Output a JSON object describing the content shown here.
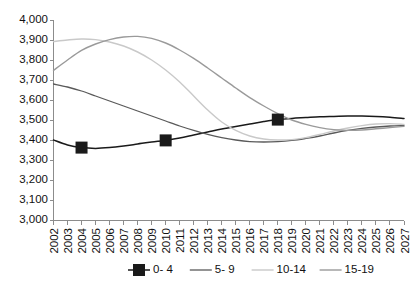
{
  "chart_data": {
    "type": "line",
    "title": "",
    "subtitle": "",
    "xlabel": "",
    "ylabel": "",
    "grid": false,
    "legend_position": "bottom",
    "ylim": [
      3000,
      4000
    ],
    "ytick_step": 100,
    "ytick_labels": [
      "4,000",
      "3,900",
      "3,800",
      "3,700",
      "3,600",
      "3,500",
      "3,400",
      "3,300",
      "3,200",
      "3,100",
      "3,000"
    ],
    "ytick_values": [
      4000,
      3900,
      3800,
      3700,
      3600,
      3500,
      3400,
      3300,
      3200,
      3100,
      3000
    ],
    "categories": [
      "2002",
      "2003",
      "2004",
      "2005",
      "2006",
      "2007",
      "2008",
      "2009",
      "2010",
      "2011",
      "2012",
      "2013",
      "2014",
      "2015",
      "2016",
      "2017",
      "2018",
      "2019",
      "2020",
      "2021",
      "2022",
      "2023",
      "2024",
      "2025",
      "2026",
      "2027"
    ],
    "x": [
      2002,
      2003,
      2004,
      2005,
      2006,
      2007,
      2008,
      2009,
      2010,
      2011,
      2012,
      2013,
      2014,
      2015,
      2016,
      2017,
      2018,
      2019,
      2020,
      2021,
      2022,
      2023,
      2024,
      2025,
      2026,
      2027
    ],
    "series": [
      {
        "name": "0- 4",
        "color": "#1a1a1a",
        "width": 1.5,
        "marker": "square",
        "marker_years": [
          2004,
          2010,
          2018
        ],
        "values": [
          3400,
          3375,
          3362,
          3358,
          3362,
          3370,
          3380,
          3390,
          3398,
          3410,
          3425,
          3440,
          3455,
          3468,
          3480,
          3492,
          3502,
          3508,
          3512,
          3516,
          3518,
          3520,
          3520,
          3518,
          3514,
          3508
        ]
      },
      {
        "name": "5- 9",
        "color": "#5a5a5a",
        "width": 1.3,
        "marker": "none",
        "marker_years": [],
        "values": [
          3680,
          3665,
          3645,
          3620,
          3595,
          3570,
          3545,
          3520,
          3495,
          3470,
          3448,
          3428,
          3412,
          3400,
          3392,
          3390,
          3392,
          3398,
          3408,
          3420,
          3435,
          3448,
          3458,
          3465,
          3470,
          3472
        ]
      },
      {
        "name": "10-14",
        "color": "#c9c9c9",
        "width": 1.4,
        "marker": "none",
        "marker_years": [],
        "values": [
          3892,
          3900,
          3905,
          3902,
          3890,
          3870,
          3840,
          3800,
          3750,
          3690,
          3620,
          3550,
          3490,
          3448,
          3420,
          3405,
          3400,
          3402,
          3412,
          3428,
          3445,
          3460,
          3472,
          3480,
          3482,
          3478
        ]
      },
      {
        "name": "15-19",
        "color": "#9a9a9a",
        "width": 1.4,
        "marker": "none",
        "marker_years": [],
        "values": [
          3748,
          3800,
          3848,
          3880,
          3902,
          3915,
          3918,
          3908,
          3885,
          3850,
          3808,
          3760,
          3710,
          3660,
          3612,
          3570,
          3532,
          3500,
          3478,
          3462,
          3452,
          3448,
          3450,
          3456,
          3462,
          3468
        ]
      }
    ]
  },
  "legend": {
    "items": [
      {
        "label": "0- 4",
        "marker": "square-with-line"
      },
      {
        "label": "5- 9",
        "marker": "line"
      },
      {
        "label": "10-14",
        "marker": "line"
      },
      {
        "label": "15-19",
        "marker": "line"
      }
    ]
  },
  "colors": {
    "axis": "#8c8c8c",
    "text": "#111111",
    "background": "#ffffff"
  }
}
